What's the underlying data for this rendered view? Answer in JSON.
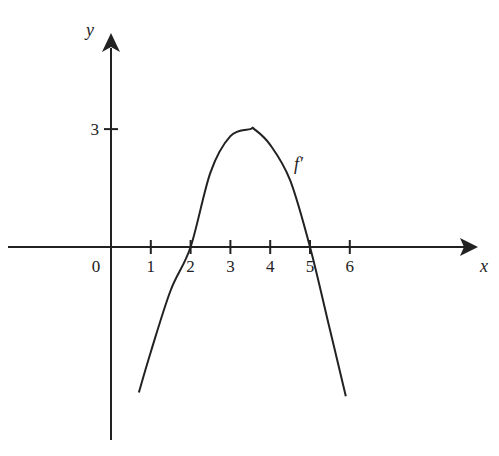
{
  "chart_data": {
    "type": "line",
    "title": "",
    "xlabel": "x",
    "ylabel": "y",
    "xlim": [
      -2.5,
      9.5
    ],
    "ylim": [
      -5,
      6
    ],
    "x_ticks": [
      1,
      2,
      3,
      4,
      5,
      6
    ],
    "x_tick_labels": [
      "1",
      "2",
      "3",
      "4",
      "5",
      "6"
    ],
    "y_ticks": [
      3
    ],
    "y_tick_labels": [
      "3"
    ],
    "origin_label": "0",
    "grid": false,
    "legend": null,
    "series": [
      {
        "name": "f'",
        "label": "f′",
        "description": "Downward parabola through (2,0) and (5,0) with maximum about 3 near x≈3.6",
        "x": [
          0.7,
          1.0,
          1.5,
          2.0,
          2.5,
          3.0,
          3.5,
          3.6,
          4.0,
          4.5,
          5.0,
          5.5,
          5.9
        ],
        "values": [
          -3.7,
          -2.67,
          -1.1,
          0.0,
          1.9,
          2.82,
          3.0,
          3.0,
          2.6,
          1.7,
          0.0,
          -2.1,
          -3.8
        ]
      }
    ],
    "annotations": [
      {
        "text": "f′",
        "x": 4.6,
        "y": 2.1
      }
    ]
  },
  "colors": {
    "background": "#ffffff",
    "ink": "#222222"
  }
}
